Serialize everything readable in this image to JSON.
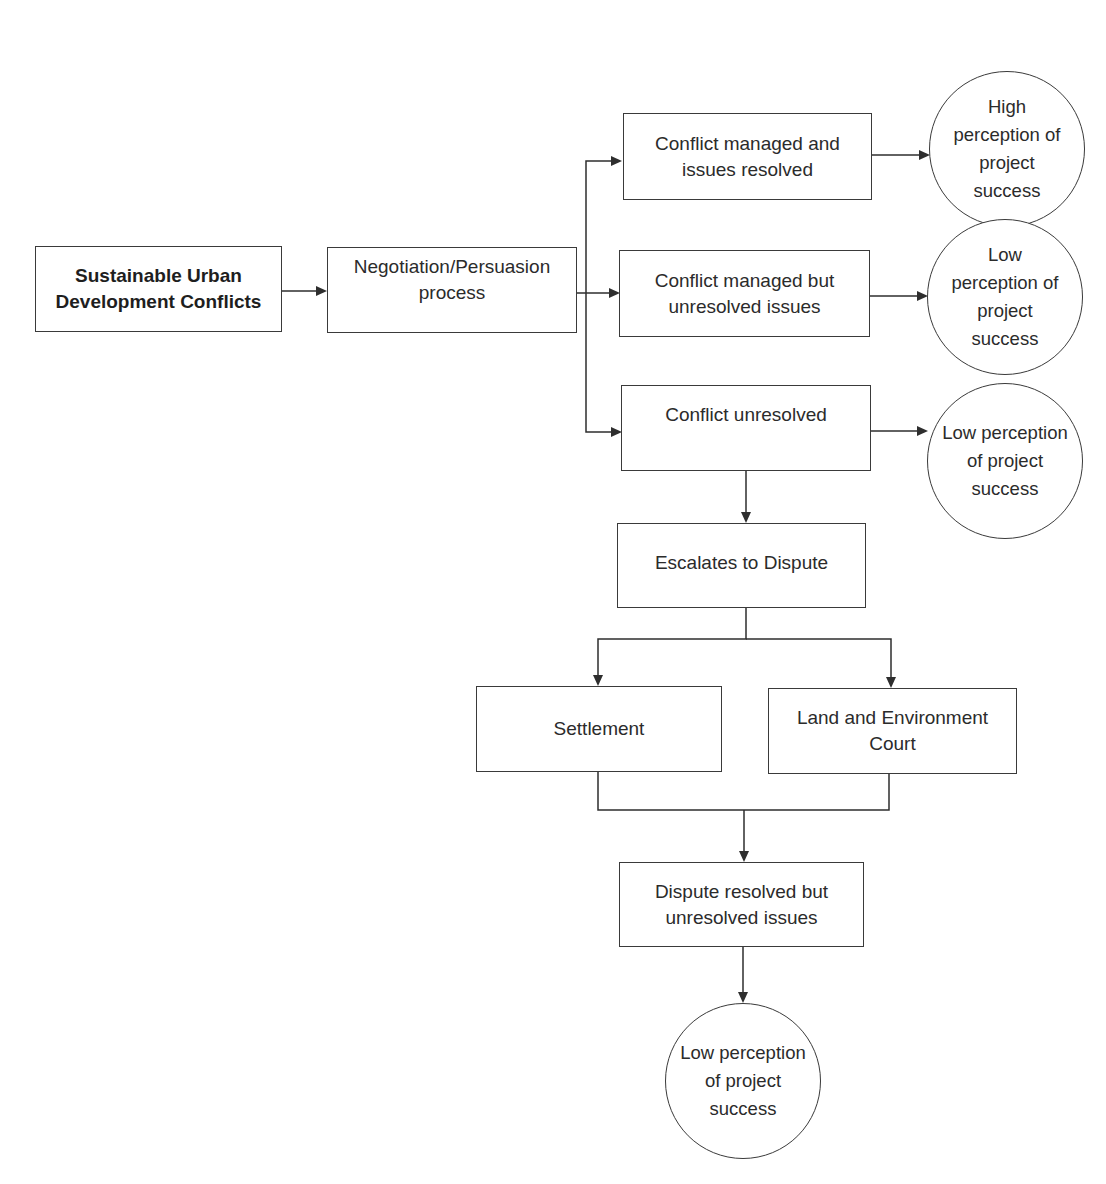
{
  "diagram": {
    "type": "flowchart",
    "nodes": {
      "start": {
        "label": "Sustainable Urban\nDevelopment Conflicts",
        "shape": "rect",
        "bold": true
      },
      "negotiation": {
        "label": "Negotiation/Persuasion\nprocess",
        "shape": "rect"
      },
      "managed_resolved": {
        "label": "Conflict managed and\nissues resolved",
        "shape": "rect"
      },
      "managed_unresolved": {
        "label": "Conflict managed but\nunresolved issues",
        "shape": "rect"
      },
      "unresolved": {
        "label": "Conflict unresolved",
        "shape": "rect"
      },
      "outcome_high": {
        "label": "High\nperception of\nproject\nsuccess",
        "shape": "circle"
      },
      "outcome_low_1": {
        "label": "Low\nperception of\nproject\nsuccess",
        "shape": "circle"
      },
      "outcome_low_2": {
        "label": "Low perception\nof project\nsuccess",
        "shape": "circle"
      },
      "escalates": {
        "label": "Escalates to Dispute",
        "shape": "rect"
      },
      "settlement": {
        "label": "Settlement",
        "shape": "rect"
      },
      "court": {
        "label": "Land and Environment\nCourt",
        "shape": "rect"
      },
      "dispute_resolved": {
        "label": "Dispute resolved but\nunresolved issues",
        "shape": "rect"
      },
      "outcome_low_3": {
        "label": "Low perception\nof project\nsuccess",
        "shape": "circle"
      }
    },
    "edges": [
      {
        "from": "start",
        "to": "negotiation"
      },
      {
        "from": "negotiation",
        "to": "managed_resolved"
      },
      {
        "from": "negotiation",
        "to": "managed_unresolved"
      },
      {
        "from": "negotiation",
        "to": "unresolved"
      },
      {
        "from": "managed_resolved",
        "to": "outcome_high"
      },
      {
        "from": "managed_unresolved",
        "to": "outcome_low_1"
      },
      {
        "from": "unresolved",
        "to": "outcome_low_2"
      },
      {
        "from": "unresolved",
        "to": "escalates"
      },
      {
        "from": "escalates",
        "to": "settlement"
      },
      {
        "from": "escalates",
        "to": "court"
      },
      {
        "from": "settlement",
        "to": "dispute_resolved"
      },
      {
        "from": "court",
        "to": "dispute_resolved"
      },
      {
        "from": "dispute_resolved",
        "to": "outcome_low_3"
      }
    ],
    "colors": {
      "line": "#2e2e2e",
      "text": "#2b2b2b",
      "background": "#ffffff"
    }
  }
}
